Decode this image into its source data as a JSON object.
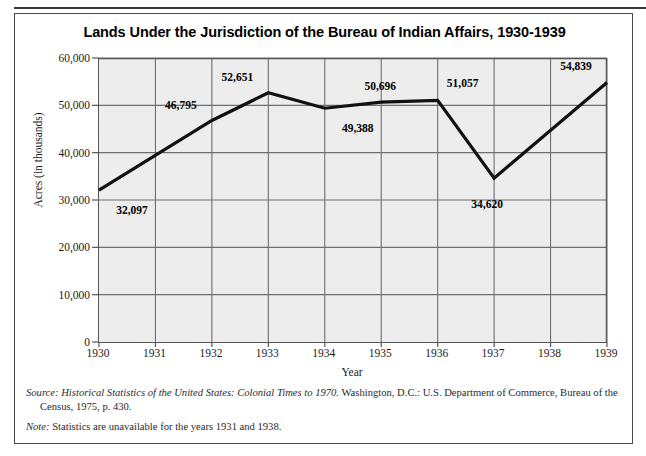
{
  "figure": {
    "title": "Lands Under the Jurisdiction of the Bureau of Indian Affairs, 1930-1939",
    "source_prefix": "Source:",
    "source_italic_title": "Historical Statistics of the United States: Colonial Times to 1970.",
    "source_rest": " Washington, D.C.: U.S. Department of Commerce, Bureau of the Census, 1975, p. 430.",
    "note_prefix": "Note:",
    "note_rest": " Statistics are unavailable for the years 1931 and 1938."
  },
  "chart_data": {
    "type": "line",
    "title": "Lands Under the Jurisdiction of the Bureau of Indian Affairs, 1930-1939",
    "xlabel": "Year",
    "ylabel": "Acres (in thousands)",
    "categories": [
      "1930",
      "1931",
      "1932",
      "1933",
      "1934",
      "1935",
      "1936",
      "1937",
      "1938",
      "1939"
    ],
    "x": [
      1930,
      1931,
      1932,
      1933,
      1934,
      1935,
      1936,
      1937,
      1938,
      1939
    ],
    "values": [
      32097,
      null,
      46795,
      52651,
      49388,
      50696,
      51057,
      34620,
      null,
      54839
    ],
    "point_labels": [
      "32,097",
      "",
      "46,795",
      "52,651",
      "49,388",
      "50,696",
      "51,057",
      "34,620",
      "",
      "54,839"
    ],
    "label_positions": [
      "below-right",
      "",
      "above-left",
      "above-left",
      "below-right",
      "above",
      "above-right",
      "below-left",
      "",
      "above-left"
    ],
    "ylim": [
      0,
      60000
    ],
    "yticks": [
      0,
      10000,
      20000,
      30000,
      40000,
      50000,
      60000
    ],
    "ytick_labels": [
      "0",
      "10,000",
      "20,000",
      "30,000",
      "40,000",
      "50,000",
      "60,000"
    ],
    "xlim": [
      1930,
      1939
    ],
    "grid": true,
    "legend": null,
    "line_color": "#111111",
    "plot_background": "#ededed",
    "grid_color": "#6f6f6f",
    "missing_years": [
      "1931",
      "1938"
    ]
  }
}
